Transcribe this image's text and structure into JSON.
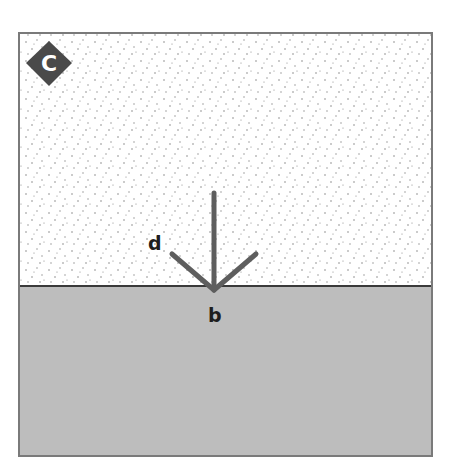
{
  "figure": {
    "panel_badge": "C",
    "labels": {
      "d": "d",
      "b": "b"
    },
    "regions": [
      {
        "name": "upper-region",
        "texture": "stippled",
        "color": "#ffffff"
      },
      {
        "name": "lower-region",
        "texture": "solid",
        "color": "#bdbdbd"
      }
    ],
    "rays": [
      {
        "name": "vertical-ray",
        "direction": "up"
      },
      {
        "name": "left-ray",
        "direction": "up-left",
        "label": "d"
      },
      {
        "name": "right-ray",
        "direction": "up-right"
      }
    ],
    "colors": {
      "frame": "#7a7a7a",
      "boundary": "#3a3a3a",
      "ray": "#5e5e5e",
      "badge": "#4a4a4a",
      "stipple": "#8a8a8a"
    }
  }
}
